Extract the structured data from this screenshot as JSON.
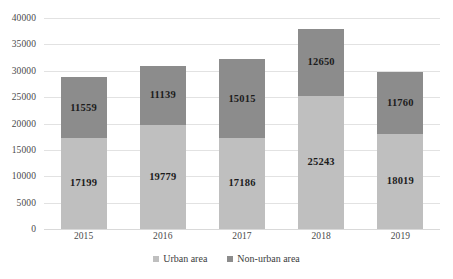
{
  "chart_data": {
    "type": "bar",
    "stacked": true,
    "title": "",
    "xlabel": "",
    "ylabel": "",
    "categories": [
      "2015",
      "2016",
      "2017",
      "2018",
      "2019"
    ],
    "series": [
      {
        "name": "Urban area",
        "color": "#bfbfbf",
        "values": [
          17199,
          19779,
          17186,
          25243,
          18019
        ]
      },
      {
        "name": "Non-urban area",
        "color": "#8c8c8c",
        "values": [
          11559,
          11139,
          15015,
          12650,
          11760
        ]
      }
    ],
    "totals": [
      28758,
      30918,
      32201,
      37893,
      29779
    ],
    "ylim": [
      0,
      40000
    ],
    "yticks": [
      "0",
      "5000",
      "10000",
      "15000",
      "20000",
      "25000",
      "30000",
      "35000",
      "40000"
    ],
    "ytick_values": [
      0,
      5000,
      10000,
      15000,
      20000,
      25000,
      30000,
      35000,
      40000
    ],
    "grid": true,
    "legend_position": "bottom",
    "gridline_color": "#e2e2e2",
    "axis_color": "#d9d9d9",
    "label_color": "#1c1c1c",
    "tick_color": "#4a4a4a"
  }
}
